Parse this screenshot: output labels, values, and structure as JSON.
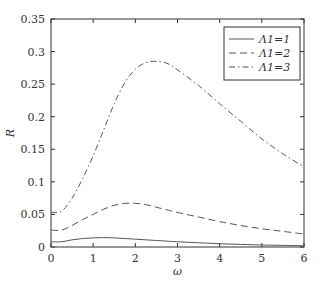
{
  "chart_data": {
    "type": "line",
    "title": "",
    "xlabel": "ω",
    "ylabel": "R",
    "xlim": [
      0,
      6
    ],
    "ylim": [
      0,
      0.35
    ],
    "xticks": [
      "0",
      "1",
      "2",
      "3",
      "4",
      "5",
      "6"
    ],
    "yticks": [
      "0",
      "0.05",
      "0.1",
      "0.15",
      "0.2",
      "0.25",
      "0.3",
      "0.35"
    ],
    "grid": false,
    "legend_position": "upper right",
    "x": [
      0,
      0.25,
      0.5,
      0.75,
      1,
      1.25,
      1.5,
      1.75,
      2,
      2.25,
      2.5,
      2.75,
      3,
      3.5,
      4,
      4.5,
      5,
      5.5,
      6
    ],
    "series": [
      {
        "name": "Λ1=1",
        "style": "solid",
        "values": [
          0.008,
          0.008,
          0.011,
          0.013,
          0.014,
          0.0145,
          0.014,
          0.013,
          0.012,
          0.011,
          0.01,
          0.009,
          0.008,
          0.0065,
          0.005,
          0.004,
          0.003,
          0.0025,
          0.002
        ]
      },
      {
        "name": "Λ1=2",
        "style": "dashed",
        "values": [
          0.026,
          0.026,
          0.033,
          0.042,
          0.05,
          0.058,
          0.064,
          0.067,
          0.067,
          0.065,
          0.061,
          0.057,
          0.053,
          0.046,
          0.039,
          0.033,
          0.028,
          0.024,
          0.02
        ]
      },
      {
        "name": "Λ1=3",
        "style": "dashdot",
        "values": [
          0.053,
          0.055,
          0.075,
          0.105,
          0.14,
          0.18,
          0.22,
          0.252,
          0.273,
          0.283,
          0.285,
          0.282,
          0.272,
          0.248,
          0.22,
          0.193,
          0.166,
          0.143,
          0.123
        ]
      }
    ]
  }
}
